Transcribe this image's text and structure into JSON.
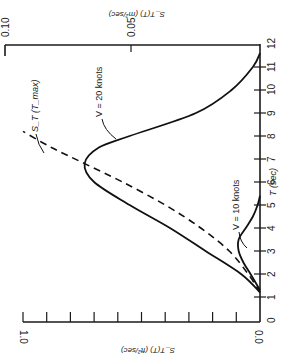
{
  "chart_data": {
    "type": "line",
    "title": "",
    "orientation": "rotated 90 degrees (T axis vertical on right, spectrum axis horizontal)",
    "xlabel": "T (sec)",
    "ylabel_bottom": "S_T(T) (ft²/sec)",
    "ylabel_top": "S_T(T) (m²/sec)",
    "x_ticks": [
      0,
      1,
      2,
      3,
      4,
      5,
      6,
      7,
      8,
      9,
      10,
      11,
      12
    ],
    "xlim": [
      0,
      12
    ],
    "ylim_bottom": [
      0.0,
      1.0
    ],
    "y_ticks_bottom": [
      0.0,
      0.1,
      0.2,
      0.3,
      0.4,
      0.5,
      0.6,
      0.7,
      0.8,
      0.9,
      1.0
    ],
    "y_tick_labels_bottom": [
      "0.0",
      "1.0"
    ],
    "ylim_top": [
      0.0,
      0.1
    ],
    "y_tick_labels_top": [
      "0.05",
      "0.10"
    ],
    "series": [
      {
        "name": "V = 20 knots",
        "style": "solid",
        "x": [
          1.2,
          2.0,
          3.0,
          4.0,
          5.0,
          6.0,
          6.8,
          7.5,
          8.0,
          9.0,
          10.0,
          11.0,
          11.6
        ],
        "values": [
          0.0,
          0.08,
          0.23,
          0.38,
          0.55,
          0.7,
          0.74,
          0.68,
          0.55,
          0.27,
          0.12,
          0.03,
          0.0
        ]
      },
      {
        "name": "V = 10 knots",
        "style": "solid",
        "x": [
          1.3,
          2.0,
          2.5,
          3.0,
          3.5,
          4.0,
          4.5,
          5.0,
          5.4
        ],
        "values": [
          0.0,
          0.04,
          0.07,
          0.09,
          0.09,
          0.06,
          0.03,
          0.01,
          0.0
        ]
      },
      {
        "name": "S_T (T_max)",
        "style": "dashed",
        "x": [
          1.2,
          2.0,
          3.0,
          4.0,
          5.0,
          6.0,
          6.8,
          7.5,
          8.2
        ],
        "values": [
          0.0,
          0.05,
          0.13,
          0.25,
          0.4,
          0.58,
          0.74,
          0.88,
          1.0
        ]
      }
    ],
    "annotations": [
      "V = 20 knots",
      "V = 10 knots",
      "S_T (T_max)"
    ],
    "grid": false
  },
  "labels": {
    "top_axis_title": "S_T(T) (m²/sec)",
    "top_tick_010": "0.10",
    "top_tick_005": "0.05",
    "bottom_axis_title": "S_T(T) (ft²/sec)",
    "bottom_tick_10": "1.0",
    "bottom_tick_00": "0.0",
    "right_axis_title": "T (sec)",
    "right_ticks": [
      "0",
      "1",
      "2",
      "3",
      "4",
      "5",
      "6",
      "7",
      "8",
      "9",
      "10",
      "11",
      "12"
    ],
    "ann_v20": "V = 20 knots",
    "ann_v10": "V = 10 knots",
    "ann_tmax": "S_T (T_max)"
  }
}
